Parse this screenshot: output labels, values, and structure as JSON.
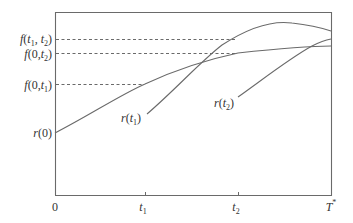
{
  "diagram": {
    "type": "forward-rate-curves",
    "colors": {
      "line": "#6a6a6a",
      "text": "#333333",
      "background": "#ffffff"
    },
    "y_labels": {
      "f_t1_t2": {
        "fn": "f",
        "open": "(",
        "a": "t",
        "a_sub": "1",
        "sep": ", ",
        "b": "t",
        "b_sub": "2",
        "close": ")"
      },
      "f_0_t2": {
        "fn": "f",
        "open": "(",
        "a": "0",
        "sep": ",",
        "b": "t",
        "b_sub": "2",
        "close": ")"
      },
      "f_0_t1": {
        "fn": "f",
        "open": "(",
        "a": "0",
        "sep": ",",
        "b": "t",
        "b_sub": "1",
        "close": ")"
      },
      "r_0": {
        "fn": "r",
        "open": "(",
        "a": "0",
        "close": ")"
      }
    },
    "x_labels": {
      "origin": "0",
      "t1": {
        "main": "t",
        "sub": "1"
      },
      "t2": {
        "main": "t",
        "sub": "2"
      },
      "T_star": {
        "main": "T",
        "sup": "*"
      }
    },
    "curve_labels": {
      "r_t1": {
        "fn": "r",
        "open": "(",
        "main": "t",
        "sub": "1",
        "close": ")"
      },
      "r_t2": {
        "fn": "r",
        "open": "(",
        "main": "t",
        "sub": "2",
        "close": ")"
      }
    }
  }
}
